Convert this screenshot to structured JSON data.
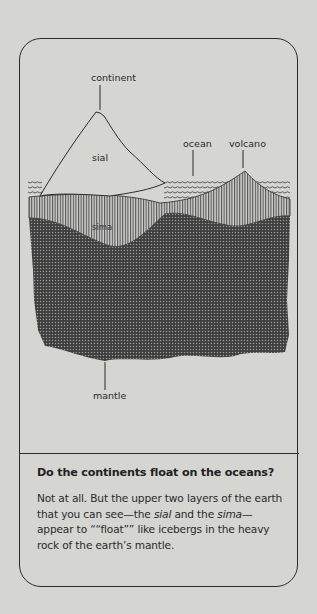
{
  "diagram": {
    "labels": {
      "continent": "continent",
      "sial": "sial",
      "ocean": "ocean",
      "volcano": "volcano",
      "sima": "sima",
      "mantle": "mantle"
    }
  },
  "caption": {
    "heading": "Do the continents float on the oceans?",
    "body_part1": "Not at all. But the upper two layers of the earth that you can see—the ",
    "term1": "sial",
    "body_part2": " and the ",
    "term2": "sima",
    "body_part3": "— appear to ““float”” like icebergs in the heavy rock of the earth’s mantle."
  },
  "colors": {
    "paper": "#d5d5d2",
    "ink": "#2b2b2b",
    "mantle": "#4a4a4a"
  }
}
